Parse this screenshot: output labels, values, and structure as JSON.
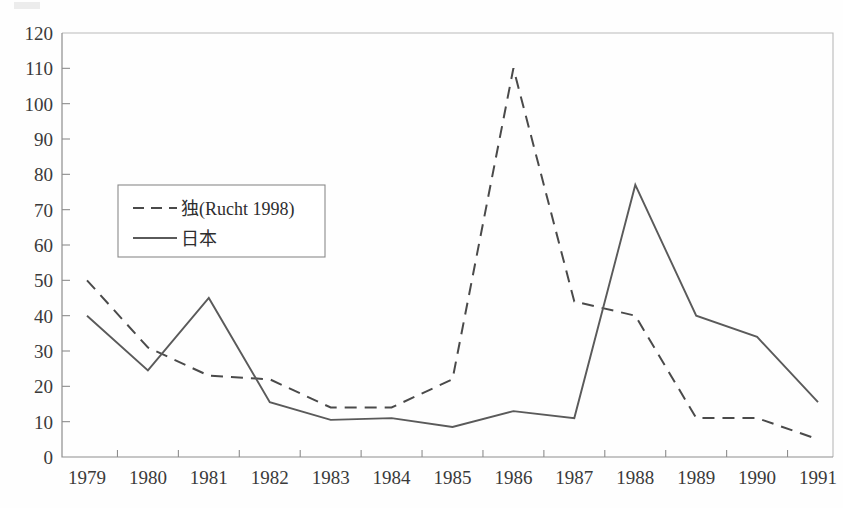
{
  "chart_data": {
    "type": "line",
    "title": "",
    "xlabel": "",
    "ylabel": "",
    "x": [
      1979,
      1980,
      1981,
      1982,
      1983,
      1984,
      1985,
      1986,
      1987,
      1988,
      1989,
      1990,
      1991
    ],
    "xticklabels": [
      "1979",
      "1980",
      "1981",
      "1982",
      "1983",
      "1984",
      "1985",
      "1986",
      "1987",
      "1988",
      "1989",
      "1990",
      "1991"
    ],
    "yticklabels": [
      "0",
      "10",
      "20",
      "30",
      "40",
      "50",
      "60",
      "70",
      "80",
      "90",
      "100",
      "110",
      "120"
    ],
    "yticks": [
      0,
      10,
      20,
      30,
      40,
      50,
      60,
      70,
      80,
      90,
      100,
      110,
      120
    ],
    "ylim": [
      0,
      120
    ],
    "xlim": [
      1979,
      1991
    ],
    "grid": false,
    "legend_position": "upper-left-inset",
    "series": [
      {
        "name": "独(Rucht 1998)",
        "style": "dashed",
        "color": "#4a4a4a",
        "values": [
          50,
          31,
          23,
          22,
          14,
          14,
          22,
          110,
          44,
          40,
          11,
          11,
          5
        ]
      },
      {
        "name": "日本",
        "style": "solid",
        "color": "#5a5a5a",
        "values": [
          40,
          24.5,
          45,
          15.5,
          10.5,
          11,
          8.5,
          13,
          11,
          77,
          40,
          34,
          15.5
        ]
      }
    ]
  },
  "legend": {
    "entries": [
      {
        "label": "独(Rucht 1998)",
        "style": "dashed"
      },
      {
        "label": "日本",
        "style": "solid"
      }
    ]
  }
}
